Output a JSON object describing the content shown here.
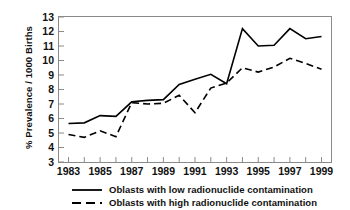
{
  "chart_data": {
    "type": "line",
    "title": "",
    "subtitle": "",
    "xlabel": "",
    "ylabel": "% Prevalence / 1000 Births",
    "xlim": [
      1982.4,
      1999.6
    ],
    "ylim": [
      3,
      13
    ],
    "grid": false,
    "legend_position": "bottom",
    "x": [
      1983,
      1984,
      1985,
      1986,
      1987,
      1988,
      1989,
      1990,
      1991,
      1992,
      1993,
      1994,
      1995,
      1996,
      1997,
      1998,
      1999
    ],
    "x_tick_labels": [
      "1983",
      "1985",
      "1987",
      "1989",
      "1991",
      "1993",
      "1995",
      "1997",
      "1999"
    ],
    "x_tick_values": [
      1983,
      1985,
      1987,
      1989,
      1991,
      1993,
      1995,
      1997,
      1999
    ],
    "x_minor_ticks": [
      1984,
      1986,
      1988,
      1990,
      1992,
      1994,
      1996,
      1998
    ],
    "y_tick_labels": [
      "3",
      "4",
      "5",
      "6",
      "7",
      "8",
      "9",
      "10",
      "11",
      "12",
      "13"
    ],
    "y_tick_values": [
      3,
      4,
      5,
      6,
      7,
      8,
      9,
      10,
      11,
      12,
      13
    ],
    "series": [
      {
        "name": "Oblasts with low radionuclide contamination",
        "style": "solid",
        "color": "#000000",
        "values": [
          5.65,
          5.7,
          6.2,
          6.15,
          7.15,
          7.25,
          7.3,
          8.35,
          8.7,
          9.05,
          8.4,
          12.2,
          11.0,
          11.05,
          12.2,
          11.5,
          11.65
        ]
      },
      {
        "name": "Oblasts with high radionuclide contamination",
        "style": "dashed",
        "color": "#000000",
        "values": [
          4.9,
          4.7,
          5.15,
          4.75,
          7.1,
          7.0,
          7.05,
          7.6,
          6.4,
          8.1,
          8.45,
          9.5,
          9.2,
          9.55,
          10.15,
          9.8,
          9.4
        ]
      }
    ]
  },
  "legend": {
    "items": [
      {
        "label": "Oblasts with low radionuclide contamination",
        "style": "solid"
      },
      {
        "label": "Oblasts with high radionuclide contamination",
        "style": "dashed"
      }
    ]
  },
  "axes": {
    "y_title": "% Prevalence / 1000 Births"
  },
  "colors": {
    "line": "#000000",
    "frame": "#8a8a8a",
    "text": "#111111",
    "background": "#ffffff"
  }
}
